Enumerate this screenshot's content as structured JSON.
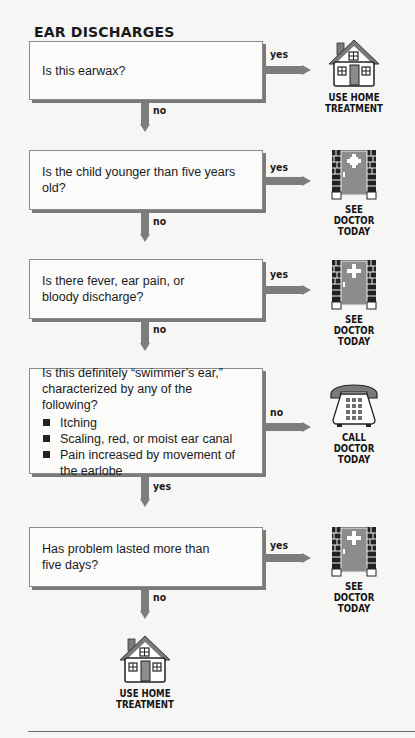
{
  "title": "EAR DISCHARGES",
  "colors": {
    "arrow": "#7d7d7d",
    "box_border": "#8a8a8a",
    "box_shadow": "#7a7a7a",
    "door": "#8c8c8c",
    "background": "#f6f6f4"
  },
  "steps": [
    {
      "question": "Is this earwax?",
      "yes_label": "yes",
      "no_label": "no",
      "yes_outcome": {
        "icon": "house-icon",
        "lines": [
          "USE HOME",
          "TREATMENT"
        ]
      }
    },
    {
      "question": "Is the child younger than five years old?",
      "yes_label": "yes",
      "no_label": "no",
      "yes_outcome": {
        "icon": "doctor-door-icon",
        "lines": [
          "SEE",
          "DOCTOR",
          "TODAY"
        ]
      }
    },
    {
      "question": "Is there fever, ear pain, or bloody discharge?",
      "yes_label": "yes",
      "no_label": "no",
      "yes_outcome": {
        "icon": "doctor-door-icon",
        "lines": [
          "SEE",
          "DOCTOR",
          "TODAY"
        ]
      }
    },
    {
      "question": "Is this definitely “swimmer’s ear,” characterized by any of the following?",
      "bullets": [
        "Itching",
        "Scaling, red, or moist ear canal",
        "Pain increased by movement of the earlobe"
      ],
      "no_label": "no",
      "yes_label": "yes",
      "no_outcome": {
        "icon": "telephone-icon",
        "lines": [
          "CALL",
          "DOCTOR",
          "TODAY"
        ]
      }
    },
    {
      "question": "Has problem lasted more than five days?",
      "yes_label": "yes",
      "no_label": "no",
      "yes_outcome": {
        "icon": "doctor-door-icon",
        "lines": [
          "SEE",
          "DOCTOR",
          "TODAY"
        ]
      }
    }
  ],
  "final_outcome": {
    "icon": "house-icon",
    "lines": [
      "USE HOME",
      "TREATMENT"
    ]
  }
}
